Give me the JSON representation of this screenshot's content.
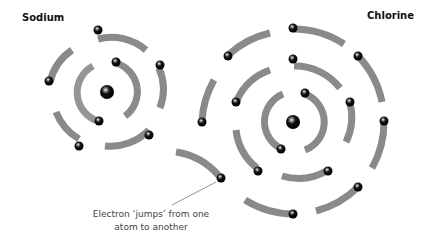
{
  "labels": {
    "sodium": "Sodium",
    "chlorine": "Chlorine"
  },
  "caption": {
    "line1": "Electron ‘jumps’ from one",
    "line2": "atom to another"
  },
  "atoms": [
    {
      "name": "Sodium",
      "nucleus": [
        107,
        92
      ],
      "shells": [
        {
          "radius": 30,
          "electrons": 2
        },
        {
          "radius": 54,
          "electrons": 5
        }
      ]
    },
    {
      "name": "Chlorine",
      "nucleus": [
        293,
        122
      ],
      "shells": [
        {
          "radius": 30,
          "electrons": 2
        },
        {
          "radius": 57,
          "electrons": 5
        },
        {
          "radius": 92,
          "electrons": 7
        }
      ]
    }
  ],
  "colors": {
    "shell": "#8a8a8a",
    "electron": "#111111",
    "text": "#111111",
    "caption": "#444444"
  }
}
